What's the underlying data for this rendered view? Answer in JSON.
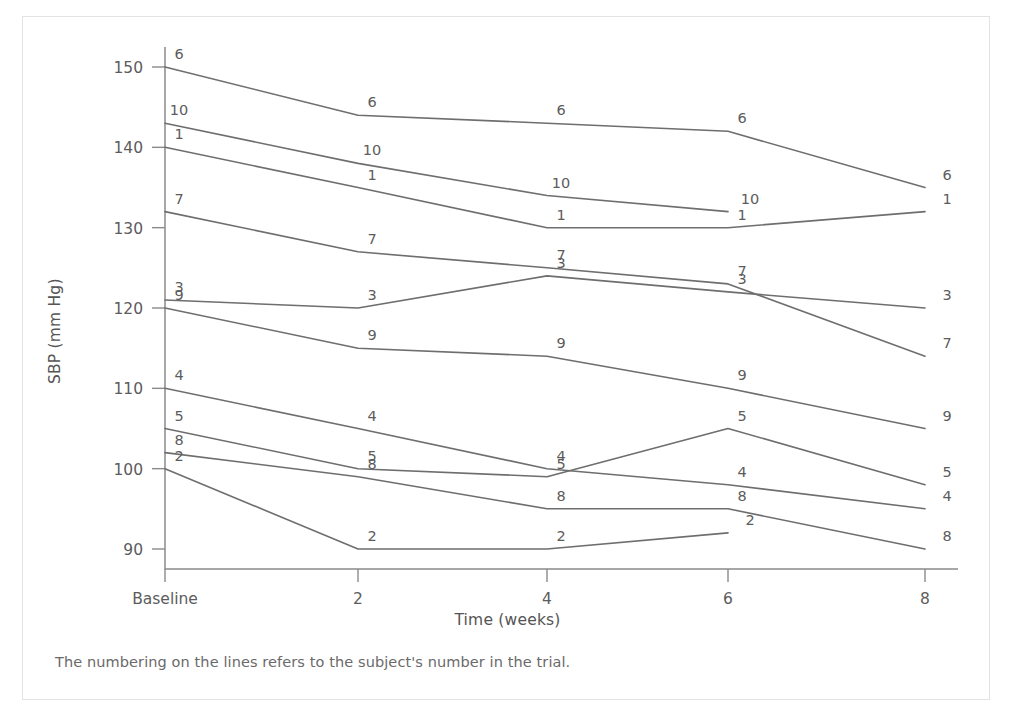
{
  "figure": {
    "caption": "The numbering on the lines refers to the subject's number in the trial.",
    "frame_color": "#e3e3e3",
    "line_color": "#6e6e6e",
    "axis_color": "#8a8a8a",
    "text_color": "#5c5c5c"
  },
  "chart_data": {
    "type": "line",
    "title": "",
    "xlabel": "Time (weeks)",
    "ylabel": "SBP (mm Hg)",
    "x": [
      0,
      2,
      4,
      6,
      8
    ],
    "categories": [
      "Baseline",
      "2",
      "4",
      "6",
      "8"
    ],
    "xtick_labels": [
      "Baseline",
      "2",
      "4",
      "6",
      "8"
    ],
    "ytick_labels": [
      "90",
      "100",
      "110",
      "120",
      "130",
      "140",
      "150"
    ],
    "yticks": [
      90,
      100,
      110,
      120,
      130,
      140,
      150
    ],
    "ylim": [
      86,
      153
    ],
    "xlim": [
      -0.6,
      8.9
    ],
    "grid": false,
    "legend": "inline-point-labels",
    "label_note": "Each polyline is labelled with the subject number at every measured timepoint.",
    "series": [
      {
        "name": "6",
        "label": "6",
        "x": [
          0,
          2,
          4,
          6,
          8
        ],
        "values": [
          150,
          144,
          143,
          142,
          135
        ]
      },
      {
        "name": "10",
        "label": "10",
        "x": [
          0,
          2,
          4,
          6
        ],
        "values": [
          143,
          138,
          134,
          132
        ]
      },
      {
        "name": "1",
        "label": "1",
        "x": [
          0,
          2,
          4,
          6,
          8
        ],
        "values": [
          140,
          135,
          130,
          130,
          132
        ]
      },
      {
        "name": "7",
        "label": "7",
        "x": [
          0,
          2,
          4,
          6,
          8
        ],
        "values": [
          132,
          127,
          125,
          123,
          114
        ]
      },
      {
        "name": "3",
        "label": "3",
        "x": [
          0,
          2,
          4,
          6,
          8
        ],
        "values": [
          121,
          120,
          124,
          122,
          120
        ]
      },
      {
        "name": "9",
        "label": "9",
        "x": [
          0,
          2,
          4,
          6,
          8
        ],
        "values": [
          120,
          115,
          114,
          110,
          105
        ]
      },
      {
        "name": "4",
        "label": "4",
        "x": [
          0,
          2,
          4,
          6,
          8
        ],
        "values": [
          110,
          105,
          100,
          98,
          95
        ]
      },
      {
        "name": "5",
        "label": "5",
        "x": [
          0,
          2,
          4,
          6,
          8
        ],
        "values": [
          105,
          100,
          99,
          105,
          98
        ]
      },
      {
        "name": "8",
        "label": "8",
        "x": [
          0,
          2,
          4,
          6,
          8
        ],
        "values": [
          102,
          99,
          95,
          95,
          90
        ]
      },
      {
        "name": "2",
        "label": "2",
        "x": [
          0,
          2,
          4,
          6
        ],
        "values": [
          100,
          90,
          90,
          92
        ]
      }
    ]
  }
}
